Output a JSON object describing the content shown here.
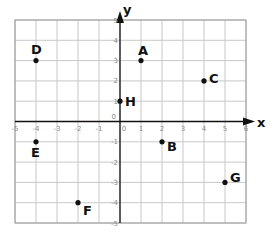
{
  "chart_data": {
    "type": "scatter",
    "title": "",
    "xlabel": "x",
    "ylabel": "y",
    "xlim": [
      -5,
      6
    ],
    "ylim": [
      -5,
      5
    ],
    "grid": true,
    "x_ticks": [
      -5,
      -4,
      -3,
      -2,
      -1,
      0,
      1,
      2,
      3,
      4,
      5,
      6
    ],
    "y_ticks": [
      -5,
      -4,
      -3,
      -2,
      -1,
      0,
      1,
      2,
      3,
      4,
      5
    ],
    "points": [
      {
        "label": "A",
        "x": 1,
        "y": 3
      },
      {
        "label": "B",
        "x": 2,
        "y": -1
      },
      {
        "label": "C",
        "x": 4,
        "y": 2
      },
      {
        "label": "D",
        "x": -4,
        "y": 3
      },
      {
        "label": "E",
        "x": -4,
        "y": -1
      },
      {
        "label": "F",
        "x": -2,
        "y": -4
      },
      {
        "label": "G",
        "x": 5,
        "y": -3
      },
      {
        "label": "H",
        "x": 0,
        "y": 1
      }
    ]
  },
  "colors": {
    "grid": "#c8c8c8",
    "border": "#9a9a9a",
    "axis": "#111111",
    "point": "#111111",
    "tick": "#8a8a8a"
  }
}
